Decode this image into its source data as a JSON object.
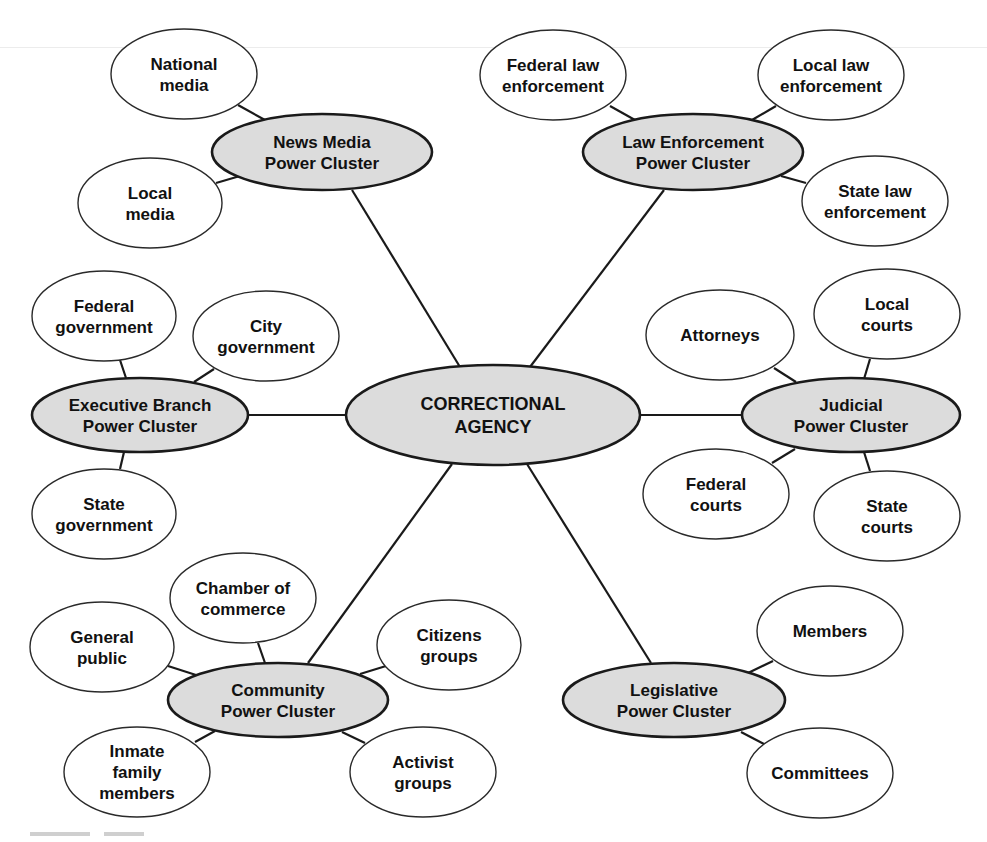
{
  "diagram": {
    "type": "hub-and-spoke power cluster diagram",
    "center": {
      "id": "center",
      "lines": [
        "CORRECTIONAL",
        "AGENCY"
      ],
      "cx": 493,
      "cy": 415,
      "rx": 147,
      "ry": 50
    },
    "clusters": [
      {
        "id": "news-media",
        "lines": [
          "News Media",
          "Power Cluster"
        ],
        "cx": 322,
        "cy": 152,
        "rx": 110,
        "ry": 38,
        "spoke": [
          [
            352,
            190
          ],
          [
            460,
            367
          ]
        ],
        "members": [
          {
            "lines": [
              "National",
              "media"
            ],
            "cx": 184,
            "cy": 74,
            "rx": 73,
            "ry": 45,
            "edge": [
              [
                238,
                105
              ],
              [
                265,
                120
              ]
            ]
          },
          {
            "lines": [
              "Local",
              "media"
            ],
            "cx": 150,
            "cy": 203,
            "rx": 72,
            "ry": 45,
            "edge": [
              [
                216,
                183
              ],
              [
                240,
                176
              ]
            ]
          }
        ]
      },
      {
        "id": "law-enforcement",
        "lines": [
          "Law Enforcement",
          "Power Cluster"
        ],
        "cx": 693,
        "cy": 152,
        "rx": 110,
        "ry": 38,
        "spoke": [
          [
            664,
            190
          ],
          [
            530,
            367
          ]
        ],
        "members": [
          {
            "lines": [
              "Federal law",
              "enforcement"
            ],
            "cx": 553,
            "cy": 75,
            "rx": 73,
            "ry": 45,
            "edge": [
              [
                610,
                106
              ],
              [
                635,
                120
              ]
            ]
          },
          {
            "lines": [
              "Local law",
              "enforcement"
            ],
            "cx": 831,
            "cy": 75,
            "rx": 73,
            "ry": 45,
            "edge": [
              [
                776,
                106
              ],
              [
                752,
                120
              ]
            ]
          },
          {
            "lines": [
              "State law",
              "enforcement"
            ],
            "cx": 875,
            "cy": 201,
            "rx": 73,
            "ry": 45,
            "edge": [
              [
                781,
                176
              ],
              [
                806,
                183
              ]
            ]
          }
        ]
      },
      {
        "id": "executive-branch",
        "lines": [
          "Executive Branch",
          "Power Cluster"
        ],
        "cx": 140,
        "cy": 415,
        "rx": 108,
        "ry": 37,
        "spoke": [
          [
            248,
            415
          ],
          [
            346,
            415
          ]
        ],
        "members": [
          {
            "lines": [
              "Federal",
              "government"
            ],
            "cx": 104,
            "cy": 316,
            "rx": 72,
            "ry": 45,
            "edge": [
              [
                120,
                360
              ],
              [
                126,
                378
              ]
            ]
          },
          {
            "lines": [
              "City",
              "government"
            ],
            "cx": 266,
            "cy": 336,
            "rx": 73,
            "ry": 45,
            "edge": [
              [
                214,
                369
              ],
              [
                194,
                382
              ]
            ]
          },
          {
            "lines": [
              "State",
              "government"
            ],
            "cx": 104,
            "cy": 514,
            "rx": 72,
            "ry": 45,
            "edge": [
              [
                120,
                469
              ],
              [
                124,
                452
              ]
            ]
          }
        ]
      },
      {
        "id": "judicial",
        "lines": [
          "Judicial",
          "Power Cluster"
        ],
        "cx": 851,
        "cy": 415,
        "rx": 109,
        "ry": 37,
        "spoke": [
          [
            640,
            415
          ],
          [
            742,
            415
          ]
        ],
        "members": [
          {
            "lines": [
              "Attorneys"
            ],
            "cx": 720,
            "cy": 335,
            "rx": 74,
            "ry": 45,
            "edge": [
              [
                774,
                368
              ],
              [
                796,
                382
              ]
            ]
          },
          {
            "lines": [
              "Local",
              "courts"
            ],
            "cx": 887,
            "cy": 314,
            "rx": 73,
            "ry": 45,
            "edge": [
              [
                870,
                359
              ],
              [
                864,
                379
              ]
            ]
          },
          {
            "lines": [
              "Federal",
              "courts"
            ],
            "cx": 716,
            "cy": 494,
            "rx": 73,
            "ry": 45,
            "edge": [
              [
                772,
                463
              ],
              [
                795,
                449
              ]
            ]
          },
          {
            "lines": [
              "State",
              "courts"
            ],
            "cx": 887,
            "cy": 516,
            "rx": 73,
            "ry": 45,
            "edge": [
              [
                870,
                471
              ],
              [
                864,
                452
              ]
            ]
          }
        ]
      },
      {
        "id": "community",
        "lines": [
          "Community",
          "Power Cluster"
        ],
        "cx": 278,
        "cy": 700,
        "rx": 110,
        "ry": 37,
        "spoke": [
          [
            308,
            663
          ],
          [
            452,
            464
          ]
        ],
        "members": [
          {
            "lines": [
              "Chamber of",
              "commerce"
            ],
            "cx": 243,
            "cy": 598,
            "rx": 73,
            "ry": 45,
            "edge": [
              [
                258,
                643
              ],
              [
                265,
                663
              ]
            ]
          },
          {
            "lines": [
              "General",
              "public"
            ],
            "cx": 102,
            "cy": 647,
            "rx": 72,
            "ry": 45,
            "edge": [
              [
                168,
                666
              ],
              [
                196,
                675
              ]
            ]
          },
          {
            "lines": [
              "Citizens",
              "groups"
            ],
            "cx": 449,
            "cy": 645,
            "rx": 72,
            "ry": 45,
            "edge": [
              [
                386,
                666
              ],
              [
                360,
                674
              ]
            ]
          },
          {
            "lines": [
              "Inmate",
              "family",
              "members"
            ],
            "cx": 137,
            "cy": 772,
            "rx": 73,
            "ry": 45,
            "edge": [
              [
                195,
                742
              ],
              [
                215,
                731
              ]
            ]
          },
          {
            "lines": [
              "Activist",
              "groups"
            ],
            "cx": 423,
            "cy": 772,
            "rx": 73,
            "ry": 45,
            "edge": [
              [
                365,
                743
              ],
              [
                342,
                732
              ]
            ]
          }
        ]
      },
      {
        "id": "legislative",
        "lines": [
          "Legislative",
          "Power Cluster"
        ],
        "cx": 674,
        "cy": 700,
        "rx": 111,
        "ry": 37,
        "spoke": [
          [
            651,
            663
          ],
          [
            527,
            464
          ]
        ],
        "members": [
          {
            "lines": [
              "Members"
            ],
            "cx": 830,
            "cy": 631,
            "rx": 73,
            "ry": 45,
            "edge": [
              [
                773,
                661
              ],
              [
                748,
                673
              ]
            ]
          },
          {
            "lines": [
              "Committees"
            ],
            "cx": 820,
            "cy": 773,
            "rx": 73,
            "ry": 45,
            "edge": [
              [
                764,
                744
              ],
              [
                741,
                732
              ]
            ]
          }
        ]
      }
    ]
  },
  "colors": {
    "cluster_fill": "#dcdcdc",
    "leaf_fill": "#ffffff",
    "stroke": "#1a1a1a",
    "text": "#111111"
  }
}
